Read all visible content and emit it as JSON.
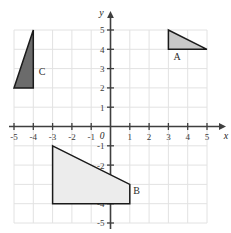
{
  "chart_data": {
    "type": "scatter",
    "title": "",
    "xlabel": "x",
    "ylabel": "y",
    "origin_label": "0",
    "xlim": [
      -5,
      5
    ],
    "ylim": [
      -5,
      5
    ],
    "grid": true,
    "x_ticks": [
      "-5",
      "-4",
      "-3",
      "-2",
      "-1",
      "1",
      "2",
      "3",
      "4",
      "5"
    ],
    "x_tick_values": [
      -5,
      -4,
      -3,
      -2,
      -1,
      1,
      2,
      3,
      4,
      5
    ],
    "y_ticks": [
      "5",
      "4",
      "3",
      "2",
      "1",
      "-1",
      "-2",
      "-3",
      "-4",
      "-5"
    ],
    "y_tick_values": [
      5,
      4,
      3,
      2,
      1,
      -1,
      -2,
      -3,
      -4,
      -5
    ],
    "shapes": [
      {
        "label": "A",
        "kind": "triangle",
        "vertices": [
          [
            3,
            5
          ],
          [
            3,
            4
          ],
          [
            5,
            4
          ]
        ],
        "fill": "#c8c8c8",
        "stroke": "#1a1a1a",
        "label_position": [
          3.45,
          3.45
        ]
      },
      {
        "label": "B",
        "kind": "quadrilateral",
        "vertices": [
          [
            -3,
            -1
          ],
          [
            1,
            -3
          ],
          [
            1,
            -4
          ],
          [
            -3,
            -4
          ]
        ],
        "fill": "#ececec",
        "stroke": "#1a1a1a",
        "label_position": [
          1.35,
          -3.5
        ]
      },
      {
        "label": "C",
        "kind": "triangle",
        "vertices": [
          [
            -4,
            5
          ],
          [
            -4,
            2
          ],
          [
            -5,
            2
          ]
        ],
        "fill": "#6b6b6b",
        "stroke": "#1a1a1a",
        "label_position": [
          -3.55,
          2.65
        ]
      }
    ],
    "colors": {
      "grid_line": "#e2e2e2",
      "axis_line": "#3f3f3f",
      "background": "#ffffff"
    }
  }
}
